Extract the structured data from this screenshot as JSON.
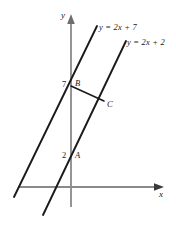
{
  "figure": {
    "kind": "coordinate-geometry-diagram",
    "background": "#ffffff",
    "axis_color": "#8a8a8a",
    "line_color": "#1a1a1a",
    "axes": {
      "x_label": "x",
      "y_label": "y",
      "origin_px": [
        71,
        187
      ]
    },
    "lines": [
      {
        "id": "line-upper",
        "label": "y = 2x + 7",
        "slope": 2,
        "intercept": 7,
        "x1": 14,
        "y1": 197,
        "x2": 97,
        "y2": 26
      },
      {
        "id": "line-lower",
        "label": "y = 2x + 2",
        "slope": 2,
        "intercept": 2,
        "x1": 43,
        "y1": 215,
        "x2": 126,
        "y2": 41
      }
    ],
    "points": [
      {
        "id": "point-a",
        "label": "A",
        "x": 71,
        "y": 157,
        "on": "line-lower",
        "tick": "2"
      },
      {
        "id": "point-b",
        "label": "B",
        "x": 71,
        "y": 86,
        "on": "line-upper",
        "tick": "7"
      },
      {
        "id": "point-c",
        "label": "C",
        "x": 104,
        "y": 101,
        "on": "line-lower",
        "tick": ""
      }
    ],
    "segments": [
      {
        "id": "segment-bc",
        "from": "B",
        "to": "C",
        "x1": 71,
        "y1": 86,
        "x2": 104,
        "y2": 101
      }
    ],
    "tick_labels": [
      {
        "id": "tick-7",
        "text": "7"
      },
      {
        "id": "tick-2",
        "text": "2"
      }
    ]
  }
}
